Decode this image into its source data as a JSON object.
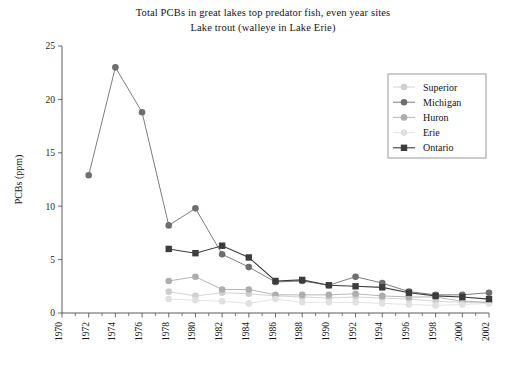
{
  "chart_data": {
    "type": "line",
    "title": "Total PCBs in great lakes top predator fish, even year sites",
    "subtitle": "Lake trout (walleye in Lake Erie)",
    "xlabel": "",
    "ylabel": "PCBs (ppm)",
    "xlim": [
      1970,
      2002
    ],
    "ylim": [
      0,
      25
    ],
    "ytick_labels": [
      "0",
      "5",
      "10",
      "15",
      "20",
      "25"
    ],
    "yticks": [
      0,
      5,
      10,
      15,
      20,
      25
    ],
    "xtick_labels": [
      "1970",
      "1972",
      "1974",
      "1976",
      "1978",
      "1980",
      "1982",
      "1984",
      "1986",
      "1988",
      "1990",
      "1992",
      "1994",
      "1996",
      "1998",
      "2000",
      "2002"
    ],
    "xticks": [
      1970,
      1972,
      1974,
      1976,
      1978,
      1980,
      1982,
      1984,
      1986,
      1988,
      1990,
      1992,
      1994,
      1996,
      1998,
      2000,
      2002
    ],
    "grid": false,
    "legend_position": "upper right",
    "series": [
      {
        "name": "Superior",
        "color": "#cfcfcf",
        "marker": "circle",
        "x": [
          1978,
          1980,
          1982,
          1984,
          1986,
          1988,
          1990,
          1992,
          1994,
          1996,
          1998,
          2000,
          2002
        ],
        "values": [
          2.0,
          1.6,
          1.9,
          1.8,
          1.6,
          1.5,
          1.4,
          1.5,
          1.4,
          1.3,
          1.1,
          1.0,
          1.0
        ]
      },
      {
        "name": "Michigan",
        "color": "#6e6e6e",
        "marker": "circle",
        "x": [
          1972,
          1974,
          1976,
          1978,
          1980,
          1982,
          1984,
          1986,
          1988,
          1990,
          1992,
          1994,
          1996,
          1998,
          2000,
          2002
        ],
        "values": [
          12.9,
          23.0,
          18.8,
          8.2,
          9.8,
          5.5,
          4.3,
          2.9,
          3.0,
          2.6,
          3.4,
          2.8,
          2.0,
          1.7,
          1.7,
          1.9
        ]
      },
      {
        "name": "Huron",
        "color": "#adadad",
        "marker": "circle",
        "x": [
          1978,
          1980,
          1982,
          1984,
          1986,
          1988,
          1990,
          1992,
          1994,
          1996,
          1998,
          2000,
          2002
        ],
        "values": [
          3.0,
          3.4,
          2.2,
          2.2,
          1.7,
          1.7,
          1.7,
          1.8,
          1.6,
          1.5,
          1.5,
          1.1,
          1.0
        ]
      },
      {
        "name": "Erie",
        "color": "#e0e0e0",
        "marker": "circle",
        "x": [
          1978,
          1980,
          1982,
          1984,
          1986,
          1988,
          1990,
          1992,
          1994,
          1996,
          1998,
          2000,
          2002
        ],
        "values": [
          1.3,
          1.2,
          1.1,
          0.9,
          1.3,
          1.0,
          1.0,
          1.0,
          0.9,
          0.8,
          0.7,
          0.8,
          0.9
        ]
      },
      {
        "name": "Ontario",
        "color": "#3c3c3c",
        "marker": "square",
        "x": [
          1978,
          1980,
          1982,
          1984,
          1986,
          1988,
          1990,
          1992,
          1994,
          1996,
          1998,
          2000,
          2002
        ],
        "values": [
          6.0,
          5.6,
          6.3,
          5.2,
          3.0,
          3.1,
          2.6,
          2.5,
          2.4,
          1.9,
          1.6,
          1.5,
          1.3
        ]
      }
    ]
  }
}
